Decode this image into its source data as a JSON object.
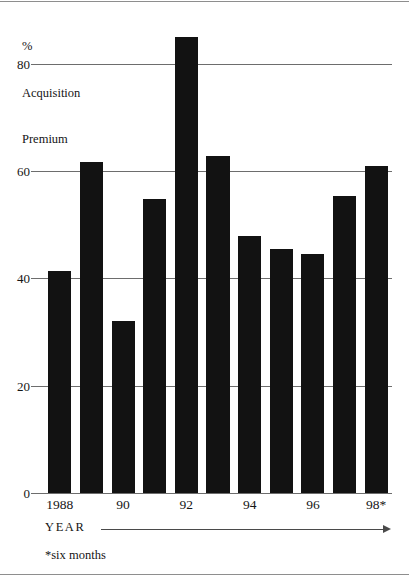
{
  "chart_data": {
    "type": "bar",
    "title": "",
    "ylabel": "% Acquisition Premium",
    "ylabel_lines": [
      "%",
      "Acquisition",
      "Premium"
    ],
    "xlabel": "YEAR",
    "categories": [
      "1988",
      "1989",
      "1990",
      "1991",
      "1992",
      "1993",
      "1994",
      "1995",
      "1996",
      "1997",
      "1998"
    ],
    "tick_labels_x": [
      "1988",
      "90",
      "92",
      "94",
      "96",
      "98*"
    ],
    "tick_label_indices": [
      0,
      2,
      4,
      6,
      8,
      10
    ],
    "values": [
      41.3,
      61.7,
      32.0,
      54.8,
      85.0,
      62.8,
      47.8,
      45.5,
      44.5,
      55.3,
      61.0
    ],
    "ylim": [
      0,
      90
    ],
    "yticks": [
      0,
      20,
      40,
      60,
      80
    ],
    "ytick_labels": [
      "0",
      "20",
      "40",
      "60",
      "80"
    ],
    "gridlines": true,
    "grid_axis": "y",
    "legend": "none",
    "bar_color": "#121212",
    "axis_color": "#6d6d6d",
    "footnote": "*six months"
  },
  "figure": {
    "y_caption": {
      "line1": "%",
      "line2": "Acquisition",
      "line3": "Premium"
    },
    "x_axis_word": "YEAR",
    "footnote_text": "*six months"
  }
}
